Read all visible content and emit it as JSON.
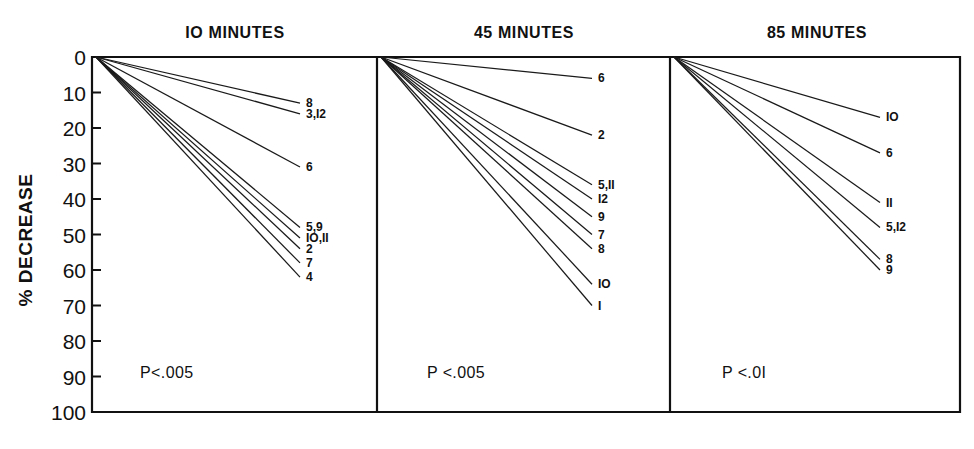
{
  "figure": {
    "y_axis_title": "% DECREASE",
    "y_ticks": [
      "0",
      "10",
      "20",
      "30",
      "40",
      "50",
      "60",
      "70",
      "80",
      "90",
      "100"
    ],
    "ink_color": "#111111",
    "background_color": "#ffffff"
  },
  "panels": [
    {
      "id": "panel-10-minutes",
      "title": "IO MINUTES",
      "pvalue": "P<.005"
    },
    {
      "id": "panel-45-minutes",
      "title": "45 MINUTES",
      "pvalue": "P <.005"
    },
    {
      "id": "panel-85-minutes",
      "title": "85 MINUTES",
      "pvalue": "P <.0I"
    }
  ],
  "chart_data": {
    "type": "line",
    "xlabel": "",
    "ylabel": "% DECREASE",
    "ylim": [
      0,
      100
    ],
    "y_inverted": true,
    "y_ticks": [
      0,
      10,
      20,
      30,
      40,
      50,
      60,
      70,
      80,
      90,
      100
    ],
    "grid": false,
    "legend": "endpoint-labels",
    "x_categories": [
      "baseline",
      "endpoint"
    ],
    "panels": [
      {
        "name": "IO MINUTES",
        "pvalue": "P<.005",
        "series": [
          {
            "name": "8",
            "label": "8",
            "values": [
              0,
              13
            ]
          },
          {
            "name": "3,12",
            "label": "3,I2",
            "values": [
              0,
              16
            ]
          },
          {
            "name": "6",
            "label": "6",
            "values": [
              0,
              31
            ]
          },
          {
            "name": "5,9",
            "label": "5,9",
            "values": [
              0,
              48
            ]
          },
          {
            "name": "10,11",
            "label": "IO,II",
            "values": [
              0,
              51
            ]
          },
          {
            "name": "2",
            "label": "2",
            "values": [
              0,
              54
            ]
          },
          {
            "name": "7",
            "label": "7",
            "values": [
              0,
              58
            ]
          },
          {
            "name": "4",
            "label": "4",
            "values": [
              0,
              62
            ]
          }
        ]
      },
      {
        "name": "45 MINUTES",
        "pvalue": "P <.005",
        "series": [
          {
            "name": "6",
            "label": "6",
            "values": [
              0,
              6
            ]
          },
          {
            "name": "2",
            "label": "2",
            "values": [
              0,
              22
            ]
          },
          {
            "name": "5,11",
            "label": "5,II",
            "values": [
              0,
              36
            ]
          },
          {
            "name": "12",
            "label": "I2",
            "values": [
              0,
              40
            ]
          },
          {
            "name": "9",
            "label": "9",
            "values": [
              0,
              45
            ]
          },
          {
            "name": "7",
            "label": "7",
            "values": [
              0,
              50
            ]
          },
          {
            "name": "8",
            "label": "8",
            "values": [
              0,
              54
            ]
          },
          {
            "name": "10",
            "label": "IO",
            "values": [
              0,
              64
            ]
          },
          {
            "name": "1",
            "label": "I",
            "values": [
              0,
              70
            ]
          }
        ]
      },
      {
        "name": "85 MINUTES",
        "pvalue": "P <.0I",
        "series": [
          {
            "name": "10",
            "label": "IO",
            "values": [
              0,
              17
            ]
          },
          {
            "name": "6",
            "label": "6",
            "values": [
              0,
              27
            ]
          },
          {
            "name": "11",
            "label": "II",
            "values": [
              0,
              41
            ]
          },
          {
            "name": "5,12",
            "label": "5,I2",
            "values": [
              0,
              48
            ]
          },
          {
            "name": "8",
            "label": "8",
            "values": [
              0,
              57
            ]
          },
          {
            "name": "9",
            "label": "9",
            "values": [
              0,
              60
            ]
          }
        ]
      }
    ]
  }
}
